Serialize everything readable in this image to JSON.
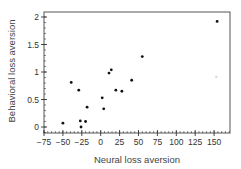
{
  "chart_data": {
    "type": "scatter",
    "title": "",
    "xlabel": "Neural loss aversion",
    "ylabel": "Behavioral loss aversion",
    "xlim": [
      -75,
      170
    ],
    "ylim": [
      -0.1,
      2.1
    ],
    "xticks": [
      -75,
      -50,
      -25,
      0,
      25,
      50,
      75,
      100,
      125,
      150
    ],
    "xtick_labels": [
      "−75",
      "−50",
      "−25",
      "0",
      "25",
      "50",
      "75",
      "100",
      "125",
      "150"
    ],
    "yticks": [
      0,
      0.5,
      1,
      1.5,
      2
    ],
    "ytick_labels": [
      "0",
      "0.5",
      "1",
      "1.5",
      "2"
    ],
    "grid": false,
    "legend": null,
    "series": [
      {
        "name": "subjects",
        "color": "#111111",
        "points": [
          {
            "x": -50,
            "y": 0.07
          },
          {
            "x": -39,
            "y": 0.81
          },
          {
            "x": -29,
            "y": 0.67
          },
          {
            "x": -27,
            "y": 0.11
          },
          {
            "x": -26,
            "y": 0.0
          },
          {
            "x": -20,
            "y": 0.1
          },
          {
            "x": -18,
            "y": 0.36
          },
          {
            "x": 2,
            "y": 0.53
          },
          {
            "x": 4,
            "y": 0.33
          },
          {
            "x": 11,
            "y": 0.98
          },
          {
            "x": 14,
            "y": 1.04
          },
          {
            "x": 20,
            "y": 0.67
          },
          {
            "x": 28,
            "y": 0.65
          },
          {
            "x": 41,
            "y": 0.85
          },
          {
            "x": 55,
            "y": 1.28
          },
          {
            "x": 154,
            "y": 1.92
          }
        ]
      },
      {
        "name": "faint-point",
        "color": "#dddddd",
        "points": [
          {
            "x": 153,
            "y": 0.91
          }
        ]
      }
    ]
  },
  "colors": {
    "axis": "#333333",
    "frame": "#555555",
    "point": "#111111"
  }
}
